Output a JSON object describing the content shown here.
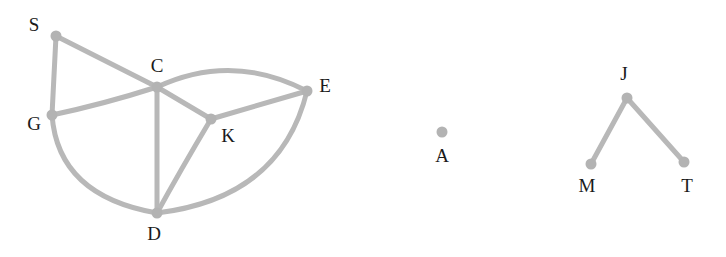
{
  "diagram": {
    "background_color": "#ffffff",
    "node_color": "#b3b3b3",
    "edge_color": "#b8b8b8",
    "label_color": "#1a1a1a",
    "node_radius": 5.5,
    "edge_width": 5.0,
    "label_font_size": 19,
    "width": 726,
    "height": 257,
    "nodes": [
      {
        "id": "S",
        "label": "S",
        "x": 56,
        "y": 36,
        "label_x": 34,
        "label_y": 27
      },
      {
        "id": "G",
        "label": "G",
        "x": 52,
        "y": 115,
        "label_x": 34,
        "label_y": 126
      },
      {
        "id": "C",
        "label": "C",
        "x": 157,
        "y": 87,
        "label_x": 157,
        "label_y": 68
      },
      {
        "id": "K",
        "label": "K",
        "x": 211,
        "y": 119,
        "label_x": 228,
        "label_y": 138
      },
      {
        "id": "E",
        "label": "E",
        "x": 307,
        "y": 91,
        "label_x": 325,
        "label_y": 88
      },
      {
        "id": "D",
        "label": "D",
        "x": 157,
        "y": 213,
        "label_x": 154,
        "label_y": 236
      },
      {
        "id": "A",
        "label": "A",
        "x": 442,
        "y": 132,
        "label_x": 442,
        "label_y": 158
      },
      {
        "id": "J",
        "label": "J",
        "x": 627,
        "y": 98,
        "label_x": 624,
        "label_y": 76
      },
      {
        "id": "M",
        "label": "M",
        "x": 591,
        "y": 164,
        "label_x": 587,
        "label_y": 188
      },
      {
        "id": "T",
        "label": "T",
        "x": 684,
        "y": 162,
        "label_x": 687,
        "label_y": 188
      }
    ],
    "edges": [
      {
        "id": "S-G",
        "source": "S",
        "target": "G",
        "path": "M 56 36 L 52 115"
      },
      {
        "id": "S-C",
        "source": "S",
        "target": "C",
        "path": "M 56 36 L 157 87"
      },
      {
        "id": "G-C",
        "source": "G",
        "target": "C",
        "path": "M 52 115 Q 104 104 157 87"
      },
      {
        "id": "G-D",
        "source": "G",
        "target": "D",
        "path": "M 52 115 Q 58 196 157 213"
      },
      {
        "id": "C-D",
        "source": "C",
        "target": "D",
        "path": "M 157 87 L 157 213"
      },
      {
        "id": "C-K",
        "source": "C",
        "target": "K",
        "path": "M 157 87 L 211 119"
      },
      {
        "id": "C-E",
        "source": "C",
        "target": "E",
        "path": "M 157 87 Q 232 52 307 91"
      },
      {
        "id": "K-E",
        "source": "K",
        "target": "E",
        "path": "M 211 119 L 307 91"
      },
      {
        "id": "K-D",
        "source": "K",
        "target": "D",
        "path": "M 211 119 Q 180 171 157 213"
      },
      {
        "id": "D-E",
        "source": "D",
        "target": "E",
        "path": "M 157 213 Q 281 198 307 91"
      },
      {
        "id": "J-M",
        "source": "J",
        "target": "M",
        "path": "M 627 98 L 591 164"
      },
      {
        "id": "J-T",
        "source": "J",
        "target": "T",
        "path": "M 627 98 L 684 162"
      }
    ],
    "components": [
      {
        "id": "component-left",
        "nodes": [
          "S",
          "G",
          "C",
          "K",
          "E",
          "D"
        ]
      },
      {
        "id": "component-middle",
        "nodes": [
          "A"
        ]
      },
      {
        "id": "component-right",
        "nodes": [
          "J",
          "M",
          "T"
        ]
      }
    ]
  },
  "chart_data": {
    "type": "diagram",
    "title": "",
    "graph_type": "undirected",
    "node_count": 10,
    "edge_count": 12,
    "component_count": 3,
    "nodes": [
      "S",
      "G",
      "C",
      "K",
      "E",
      "D",
      "A",
      "J",
      "M",
      "T"
    ],
    "edges": [
      [
        "S",
        "G"
      ],
      [
        "S",
        "C"
      ],
      [
        "G",
        "C"
      ],
      [
        "G",
        "D"
      ],
      [
        "C",
        "D"
      ],
      [
        "C",
        "K"
      ],
      [
        "C",
        "E"
      ],
      [
        "K",
        "E"
      ],
      [
        "K",
        "D"
      ],
      [
        "D",
        "E"
      ],
      [
        "J",
        "M"
      ],
      [
        "J",
        "T"
      ]
    ]
  }
}
